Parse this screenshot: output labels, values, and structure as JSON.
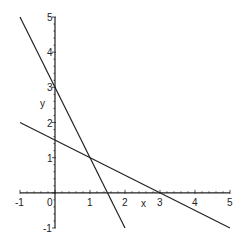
{
  "chart_data": {
    "type": "line",
    "title": "",
    "xlabel": "x",
    "ylabel": "y",
    "xlim": [
      -1,
      5
    ],
    "ylim": [
      -1,
      5
    ],
    "grid": false,
    "legend": null,
    "x_ticks": [
      -1,
      0,
      1,
      2,
      3,
      4,
      5
    ],
    "y_ticks": [
      -1,
      0,
      1,
      2,
      3,
      4,
      5
    ],
    "series": [
      {
        "name": "y = 3 - 2x",
        "x": [
          -1,
          2
        ],
        "y": [
          5,
          -1
        ]
      },
      {
        "name": "y = 1.5 - 0.5x",
        "x": [
          -1,
          5
        ],
        "y": [
          2,
          -1
        ]
      }
    ],
    "annotations": [
      {
        "label": "intersection",
        "x": 1,
        "y": 1
      }
    ]
  },
  "labels": {
    "x_axis": "x",
    "y_axis": "y",
    "x_ticks": [
      "-1",
      "0",
      "1",
      "2",
      "3",
      "4",
      "5"
    ],
    "y_ticks": [
      "-1",
      "1",
      "2",
      "3",
      "4",
      "5"
    ]
  },
  "colors": {
    "line": "#222222",
    "axis": "#222222"
  }
}
